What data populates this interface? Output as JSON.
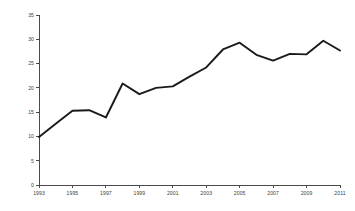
{
  "chart_data": {
    "type": "line",
    "title": "",
    "subtitle": "",
    "xlabel": "",
    "ylabel": "",
    "legend": [],
    "legend_position": "none",
    "grid": false,
    "xlim": [
      1993,
      2011
    ],
    "ylim": [
      0,
      35
    ],
    "x": [
      1993,
      1994,
      1995,
      1996,
      1997,
      1998,
      1999,
      2000,
      2001,
      2002,
      2003,
      2004,
      2005,
      2006,
      2007,
      2008,
      2009,
      2010,
      2011
    ],
    "values": [
      9.9,
      12.6,
      15.3,
      15.4,
      13.9,
      20.9,
      18.7,
      20.0,
      20.3,
      22.3,
      24.2,
      27.9,
      29.3,
      26.8,
      25.6,
      27.0,
      26.9,
      29.7,
      27.7
    ],
    "series": [
      {
        "name": "series-1",
        "color": "#1a1a1a",
        "values": [
          9.9,
          12.6,
          15.3,
          15.4,
          13.9,
          20.9,
          18.7,
          20.0,
          20.3,
          22.3,
          24.2,
          27.9,
          29.3,
          26.8,
          25.6,
          27.0,
          26.9,
          29.7,
          27.7
        ]
      }
    ],
    "x_tick_labels": [
      "1993",
      "1995",
      "1997",
      "1999",
      "2001",
      "2003",
      "2005",
      "2007",
      "2009",
      "2011"
    ],
    "x_tick_values": [
      1993,
      1995,
      1997,
      1999,
      2001,
      2003,
      2005,
      2007,
      2009,
      2011
    ],
    "y_tick_labels": [
      "0",
      "5",
      "10",
      "15",
      "20",
      "25",
      "30",
      "35"
    ],
    "y_tick_values": [
      0,
      5,
      10,
      15,
      20,
      25,
      30,
      35
    ],
    "axis_color": "#4a4a4a",
    "background_color": "#ffffff"
  }
}
